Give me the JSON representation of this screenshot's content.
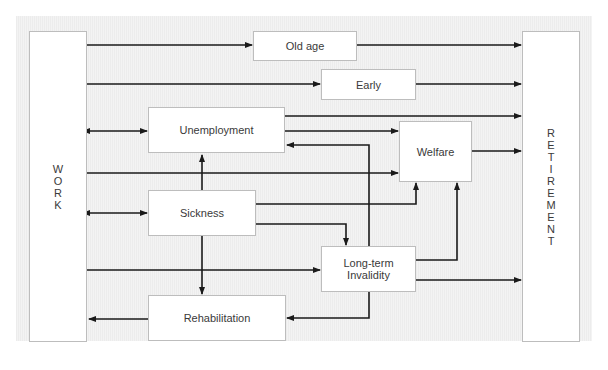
{
  "diagram": {
    "left_block": {
      "label": "WORK",
      "letters": [
        "W",
        "O",
        "R",
        "K"
      ]
    },
    "right_block": {
      "label": "RETIREMENT",
      "letters": [
        "R",
        "E",
        "T",
        "I",
        "R",
        "E",
        "M",
        "E",
        "N",
        "T"
      ]
    },
    "nodes": {
      "old_age": "Old age",
      "early": "Early",
      "unemployment": "Unemployment",
      "welfare": "Welfare",
      "sickness": "Sickness",
      "long_term_invalidity_line1": "Long-term",
      "long_term_invalidity_line2": "Invalidity",
      "rehabilitation": "Rehabilitation"
    },
    "edges": [
      {
        "from": "Work",
        "to": "Old age"
      },
      {
        "from": "Old age",
        "to": "Retirement"
      },
      {
        "from": "Work",
        "to": "Early"
      },
      {
        "from": "Early",
        "to": "Retirement"
      },
      {
        "from": "Work",
        "to": "Unemployment",
        "bidirectional": true
      },
      {
        "from": "Unemployment",
        "to": "Retirement"
      },
      {
        "from": "Unemployment",
        "to": "Welfare"
      },
      {
        "from": "Long-term Invalidity",
        "to": "Unemployment"
      },
      {
        "from": "Work",
        "to": "Welfare"
      },
      {
        "from": "Welfare",
        "to": "Retirement"
      },
      {
        "from": "Work",
        "to": "Sickness",
        "bidirectional": true
      },
      {
        "from": "Sickness",
        "to": "Unemployment"
      },
      {
        "from": "Sickness",
        "to": "Welfare"
      },
      {
        "from": "Sickness",
        "to": "Long-term Invalidity"
      },
      {
        "from": "Sickness",
        "to": "Rehabilitation"
      },
      {
        "from": "Work",
        "to": "Long-term Invalidity"
      },
      {
        "from": "Long-term Invalidity",
        "to": "Welfare"
      },
      {
        "from": "Long-term Invalidity",
        "to": "Retirement"
      },
      {
        "from": "Long-term Invalidity",
        "to": "Rehabilitation"
      },
      {
        "from": "Rehabilitation",
        "to": "Work"
      }
    ],
    "colors": {
      "line": "#1a1a1a",
      "box_border": "#bdbdbd",
      "text": "#3a3a3a"
    }
  }
}
